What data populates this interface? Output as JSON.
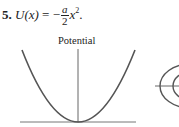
{
  "problem": {
    "number": "5.",
    "lhs": "U(x)",
    "equals": "=",
    "sign": "−",
    "fraction": {
      "numerator": "a",
      "denominator": "2"
    },
    "variable": "x",
    "exponent": "2",
    "end": "."
  },
  "figure": {
    "left_panel_label": "Potential",
    "colors": {
      "curve": "#555555",
      "axis": "#666666"
    }
  }
}
